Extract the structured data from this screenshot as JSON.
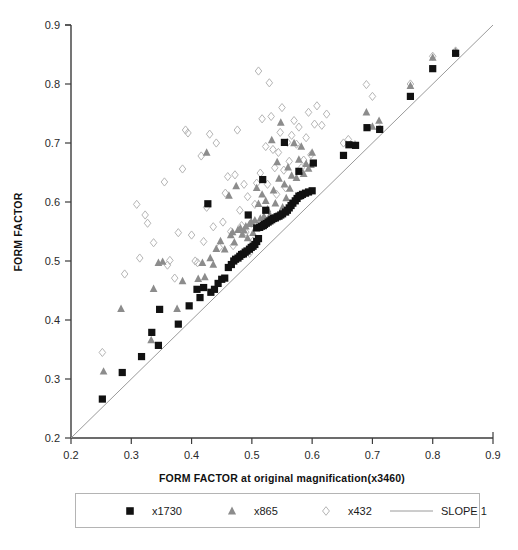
{
  "chart_data": {
    "type": "scatter",
    "title": "",
    "xlabel": "FORM FACTOR at original magnification(x3460)",
    "ylabel": "FORM FACTOR",
    "xlim": [
      0.2,
      0.9
    ],
    "ylim": [
      0.2,
      0.9
    ],
    "xticks": [
      "0.2",
      "0.3",
      "0.4",
      "0.5",
      "0.6",
      "0.7",
      "0.8",
      "0.9"
    ],
    "yticks": [
      "0.2",
      "0.3",
      "0.4",
      "0.5",
      "0.6",
      "0.7",
      "0.8",
      "0.9"
    ],
    "xtick_values": [
      0.2,
      0.3,
      0.4,
      0.5,
      0.6,
      0.7,
      0.8,
      0.9
    ],
    "ytick_values": [
      0.2,
      0.3,
      0.4,
      0.5,
      0.6,
      0.7,
      0.8,
      0.9
    ],
    "grid": false,
    "legend_position": "bottom",
    "reference_line": {
      "name": "SLOPE 1",
      "slope": 1,
      "intercept": 0,
      "from": [
        0.2,
        0.2
      ],
      "to": [
        0.9,
        0.9
      ],
      "color": "#9a9a9a"
    },
    "series": [
      {
        "name": "x1730",
        "marker": "filled-square",
        "color": "#111111",
        "points": [
          [
            0.252,
            0.266
          ],
          [
            0.285,
            0.311
          ],
          [
            0.317,
            0.338
          ],
          [
            0.334,
            0.379
          ],
          [
            0.345,
            0.357
          ],
          [
            0.347,
            0.418
          ],
          [
            0.378,
            0.393
          ],
          [
            0.396,
            0.424
          ],
          [
            0.409,
            0.452
          ],
          [
            0.414,
            0.438
          ],
          [
            0.42,
            0.455
          ],
          [
            0.427,
            0.597
          ],
          [
            0.432,
            0.447
          ],
          [
            0.438,
            0.452
          ],
          [
            0.444,
            0.462
          ],
          [
            0.45,
            0.469
          ],
          [
            0.455,
            0.471
          ],
          [
            0.461,
            0.489
          ],
          [
            0.466,
            0.494
          ],
          [
            0.47,
            0.5
          ],
          [
            0.473,
            0.503
          ],
          [
            0.477,
            0.505
          ],
          [
            0.48,
            0.508
          ],
          [
            0.483,
            0.511
          ],
          [
            0.486,
            0.512
          ],
          [
            0.489,
            0.515
          ],
          [
            0.492,
            0.517
          ],
          [
            0.494,
            0.578
          ],
          [
            0.496,
            0.52
          ],
          [
            0.499,
            0.523
          ],
          [
            0.502,
            0.525
          ],
          [
            0.505,
            0.528
          ],
          [
            0.508,
            0.533
          ],
          [
            0.511,
            0.538
          ],
          [
            0.508,
            0.556
          ],
          [
            0.513,
            0.557
          ],
          [
            0.516,
            0.559
          ],
          [
            0.519,
            0.56
          ],
          [
            0.521,
            0.562
          ],
          [
            0.518,
            0.638
          ],
          [
            0.524,
            0.564
          ],
          [
            0.527,
            0.566
          ],
          [
            0.523,
            0.586
          ],
          [
            0.53,
            0.568
          ],
          [
            0.533,
            0.57
          ],
          [
            0.536,
            0.572
          ],
          [
            0.539,
            0.573
          ],
          [
            0.542,
            0.575
          ],
          [
            0.545,
            0.576
          ],
          [
            0.548,
            0.578
          ],
          [
            0.551,
            0.58
          ],
          [
            0.554,
            0.701
          ],
          [
            0.556,
            0.583
          ],
          [
            0.559,
            0.586
          ],
          [
            0.562,
            0.59
          ],
          [
            0.565,
            0.594
          ],
          [
            0.568,
            0.598
          ],
          [
            0.572,
            0.602
          ],
          [
            0.575,
            0.606
          ],
          [
            0.578,
            0.61
          ],
          [
            0.581,
            0.611
          ],
          [
            0.584,
            0.613
          ],
          [
            0.578,
            0.652
          ],
          [
            0.589,
            0.615
          ],
          [
            0.594,
            0.617
          ],
          [
            0.6,
            0.619
          ],
          [
            0.602,
            0.666
          ],
          [
            0.652,
            0.679
          ],
          [
            0.661,
            0.697
          ],
          [
            0.672,
            0.696
          ],
          [
            0.691,
            0.726
          ],
          [
            0.712,
            0.723
          ],
          [
            0.763,
            0.779
          ],
          [
            0.8,
            0.826
          ],
          [
            0.838,
            0.852
          ]
        ]
      },
      {
        "name": "x865",
        "marker": "filled-triangle",
        "color": "#8c8c8c",
        "points": [
          [
            0.254,
            0.313
          ],
          [
            0.283,
            0.419
          ],
          [
            0.333,
            0.366
          ],
          [
            0.337,
            0.453
          ],
          [
            0.345,
            0.497
          ],
          [
            0.352,
            0.499
          ],
          [
            0.376,
            0.419
          ],
          [
            0.385,
            0.466
          ],
          [
            0.411,
            0.47
          ],
          [
            0.418,
            0.497
          ],
          [
            0.422,
            0.473
          ],
          [
            0.425,
            0.684
          ],
          [
            0.431,
            0.505
          ],
          [
            0.436,
            0.494
          ],
          [
            0.441,
            0.521
          ],
          [
            0.448,
            0.534
          ],
          [
            0.455,
            0.52
          ],
          [
            0.462,
            0.611
          ],
          [
            0.465,
            0.544
          ],
          [
            0.468,
            0.549
          ],
          [
            0.471,
            0.532
          ],
          [
            0.474,
            0.627
          ],
          [
            0.477,
            0.553
          ],
          [
            0.481,
            0.556
          ],
          [
            0.484,
            0.545
          ],
          [
            0.487,
            0.552
          ],
          [
            0.49,
            0.559
          ],
          [
            0.493,
            0.539
          ],
          [
            0.496,
            0.563
          ],
          [
            0.499,
            0.566
          ],
          [
            0.502,
            0.548
          ],
          [
            0.505,
            0.569
          ],
          [
            0.508,
            0.624
          ],
          [
            0.511,
            0.597
          ],
          [
            0.514,
            0.572
          ],
          [
            0.517,
            0.613
          ],
          [
            0.52,
            0.576
          ],
          [
            0.523,
            0.602
          ],
          [
            0.526,
            0.588
          ],
          [
            0.53,
            0.578
          ],
          [
            0.533,
            0.705
          ],
          [
            0.536,
            0.62
          ],
          [
            0.539,
            0.598
          ],
          [
            0.542,
            0.668
          ],
          [
            0.545,
            0.64
          ],
          [
            0.548,
            0.735
          ],
          [
            0.551,
            0.591
          ],
          [
            0.554,
            0.63
          ],
          [
            0.557,
            0.607
          ],
          [
            0.56,
            0.659
          ],
          [
            0.563,
            0.623
          ],
          [
            0.566,
            0.645
          ],
          [
            0.57,
            0.7
          ],
          [
            0.574,
            0.641
          ],
          [
            0.578,
            0.672
          ],
          [
            0.582,
            0.694
          ],
          [
            0.586,
            0.648
          ],
          [
            0.59,
            0.665
          ],
          [
            0.594,
            0.657
          ],
          [
            0.598,
            0.663
          ],
          [
            0.6,
            0.684
          ],
          [
            0.69,
            0.752
          ],
          [
            0.7,
            0.728
          ],
          [
            0.711,
            0.738
          ],
          [
            0.763,
            0.797
          ],
          [
            0.8,
            0.845
          ],
          [
            0.838,
            0.855
          ]
        ]
      },
      {
        "name": "x432",
        "marker": "open-diamond",
        "color": "#b5b5b5",
        "points": [
          [
            0.252,
            0.345
          ],
          [
            0.289,
            0.478
          ],
          [
            0.309,
            0.596
          ],
          [
            0.314,
            0.505
          ],
          [
            0.323,
            0.578
          ],
          [
            0.327,
            0.564
          ],
          [
            0.337,
            0.531
          ],
          [
            0.355,
            0.634
          ],
          [
            0.36,
            0.493
          ],
          [
            0.364,
            0.501
          ],
          [
            0.372,
            0.471
          ],
          [
            0.378,
            0.548
          ],
          [
            0.385,
            0.656
          ],
          [
            0.39,
            0.722
          ],
          [
            0.394,
            0.717
          ],
          [
            0.4,
            0.544
          ],
          [
            0.406,
            0.5
          ],
          [
            0.41,
            0.497
          ],
          [
            0.416,
            0.678
          ],
          [
            0.42,
            0.533
          ],
          [
            0.425,
            0.591
          ],
          [
            0.43,
            0.715
          ],
          [
            0.436,
            0.558
          ],
          [
            0.441,
            0.7
          ],
          [
            0.446,
            0.523
          ],
          [
            0.452,
            0.566
          ],
          [
            0.456,
            0.615
          ],
          [
            0.46,
            0.643
          ],
          [
            0.465,
            0.55
          ],
          [
            0.469,
            0.526
          ],
          [
            0.472,
            0.646
          ],
          [
            0.476,
            0.722
          ],
          [
            0.48,
            0.586
          ],
          [
            0.483,
            0.56
          ],
          [
            0.487,
            0.63
          ],
          [
            0.49,
            0.549
          ],
          [
            0.493,
            0.609
          ],
          [
            0.496,
            0.513
          ],
          [
            0.499,
            0.564
          ],
          [
            0.502,
            0.534
          ],
          [
            0.505,
            0.596
          ],
          [
            0.508,
            0.632
          ],
          [
            0.511,
            0.822
          ],
          [
            0.514,
            0.649
          ],
          [
            0.517,
            0.741
          ],
          [
            0.52,
            0.567
          ],
          [
            0.523,
            0.694
          ],
          [
            0.526,
            0.63
          ],
          [
            0.529,
            0.802
          ],
          [
            0.532,
            0.745
          ],
          [
            0.535,
            0.689
          ],
          [
            0.538,
            0.658
          ],
          [
            0.541,
            0.613
          ],
          [
            0.544,
            0.684
          ],
          [
            0.547,
            0.718
          ],
          [
            0.55,
            0.76
          ],
          [
            0.553,
            0.654
          ],
          [
            0.556,
            0.624
          ],
          [
            0.559,
            0.701
          ],
          [
            0.562,
            0.669
          ],
          [
            0.566,
            0.713
          ],
          [
            0.57,
            0.738
          ],
          [
            0.574,
            0.698
          ],
          [
            0.578,
            0.727
          ],
          [
            0.582,
            0.658
          ],
          [
            0.586,
            0.671
          ],
          [
            0.59,
            0.709
          ],
          [
            0.594,
            0.752
          ],
          [
            0.598,
            0.68
          ],
          [
            0.604,
            0.732
          ],
          [
            0.608,
            0.763
          ],
          [
            0.616,
            0.73
          ],
          [
            0.624,
            0.749
          ],
          [
            0.652,
            0.7
          ],
          [
            0.66,
            0.706
          ],
          [
            0.671,
            0.697
          ],
          [
            0.69,
            0.799
          ],
          [
            0.7,
            0.779
          ],
          [
            0.712,
            0.724
          ],
          [
            0.763,
            0.8
          ],
          [
            0.8,
            0.847
          ],
          [
            0.838,
            0.856
          ]
        ]
      }
    ]
  },
  "legend": {
    "items": [
      {
        "label": "x1730",
        "marker": "filled-square"
      },
      {
        "label": "x865",
        "marker": "filled-triangle"
      },
      {
        "label": "x432",
        "marker": "open-diamond"
      },
      {
        "label": "SLOPE 1",
        "marker": "line"
      }
    ]
  },
  "colors": {
    "series_1730": "#111111",
    "series_865": "#8c8c8c",
    "series_432": "#b5b5b5",
    "slope_line": "#9a9a9a",
    "axis": "#3b3b3b",
    "background": "#ffffff"
  }
}
